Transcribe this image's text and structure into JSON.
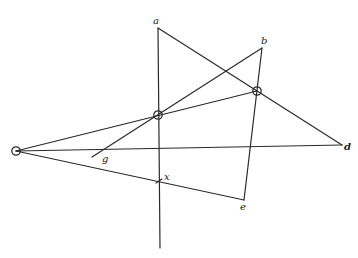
{
  "diagram": {
    "points": {
      "O": {
        "x": 16,
        "y": 151
      },
      "P1": {
        "x": 158,
        "y": 115
      },
      "P2": {
        "x": 257,
        "y": 91
      },
      "a": {
        "x": 158,
        "y": 28
      },
      "vbottom": {
        "x": 160,
        "y": 248
      },
      "b": {
        "x": 262,
        "y": 48
      },
      "d": {
        "x": 342,
        "y": 145
      },
      "e": {
        "x": 244,
        "y": 200
      },
      "g": {
        "x": 92,
        "y": 157
      },
      "x": {
        "x": 159,
        "y": 181
      }
    },
    "labels": {
      "a": "a",
      "b": "b",
      "d": "d",
      "e": "e",
      "g": "g",
      "x": "x"
    }
  }
}
